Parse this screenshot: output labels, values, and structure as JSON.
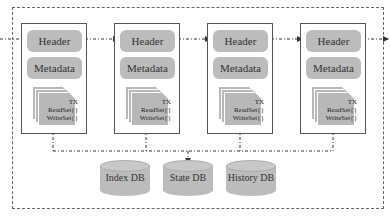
{
  "diagram": {
    "blocks": [
      {
        "header": "Header",
        "metadata": "Metadata",
        "tx": "TX",
        "read_set": "ReadSet{}",
        "write_set": "WriteSet{}"
      },
      {
        "header": "Header",
        "metadata": "Metadata",
        "tx": "TX",
        "read_set": "ReadSet{}",
        "write_set": "WriteSet{}"
      },
      {
        "header": "Header",
        "metadata": "Metadata",
        "tx": "TX",
        "read_set": "ReadSet{}",
        "write_set": "WriteSet{}"
      },
      {
        "header": "Header",
        "metadata": "Metadata",
        "tx": "TX",
        "read_set": "ReadSet{}",
        "write_set": "WriteSet{}"
      }
    ],
    "databases": [
      {
        "label": "Index DB"
      },
      {
        "label": "State DB"
      },
      {
        "label": "History DB"
      }
    ]
  }
}
